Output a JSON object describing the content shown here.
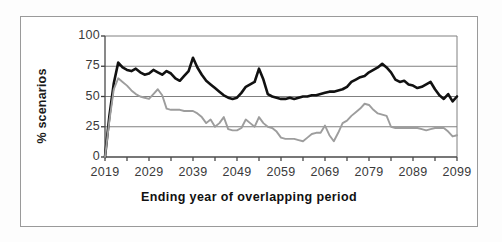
{
  "chart_data": {
    "type": "line",
    "title": "",
    "xlabel": "Ending year of overlapping period",
    "ylabel": "% scenarios",
    "xlim": [
      2019,
      2099
    ],
    "ylim": [
      0,
      100
    ],
    "grid": true,
    "legend": "none",
    "y_ticks": [
      0,
      25,
      50,
      75,
      100
    ],
    "y_tick_labels": [
      "0",
      "25",
      "50",
      "75",
      "100"
    ],
    "x_ticks": [
      2019,
      2029,
      2039,
      2049,
      2059,
      2069,
      2079,
      2089,
      2099
    ],
    "x_tick_labels": [
      "2019",
      "2029",
      "2039",
      "2049",
      "2059",
      "2069",
      "2079",
      "2089",
      "2099"
    ],
    "x_minor_tick_interval": 5,
    "x": [
      2019,
      2020,
      2021,
      2022,
      2023,
      2024,
      2025,
      2026,
      2027,
      2028,
      2029,
      2030,
      2031,
      2032,
      2033,
      2034,
      2035,
      2036,
      2037,
      2038,
      2039,
      2040,
      2041,
      2042,
      2043,
      2044,
      2045,
      2046,
      2047,
      2048,
      2049,
      2050,
      2051,
      2052,
      2053,
      2054,
      2055,
      2056,
      2057,
      2058,
      2059,
      2060,
      2061,
      2062,
      2063,
      2064,
      2065,
      2066,
      2067,
      2068,
      2069,
      2070,
      2071,
      2072,
      2073,
      2074,
      2075,
      2076,
      2077,
      2078,
      2079,
      2080,
      2081,
      2082,
      2083,
      2084,
      2085,
      2086,
      2087,
      2088,
      2089,
      2090,
      2091,
      2092,
      2093,
      2094,
      2095,
      2096,
      2097,
      2098,
      2099
    ],
    "series": [
      {
        "name": "upper-series-black",
        "color": "#111111",
        "line_width": 2.6,
        "values": [
          0,
          34,
          61,
          78,
          74,
          72,
          71,
          73,
          70,
          68,
          69,
          72,
          70,
          68,
          71,
          69,
          65,
          63,
          67,
          71,
          82,
          74,
          68,
          63,
          60,
          57,
          54,
          51,
          49,
          48,
          49,
          53,
          58,
          60,
          62,
          73,
          64,
          52,
          50,
          49,
          48,
          48,
          49,
          48,
          49,
          50,
          50,
          51,
          51,
          52,
          53,
          54,
          54,
          55,
          56,
          58,
          62,
          64,
          66,
          67,
          70,
          72,
          74,
          77,
          74,
          70,
          64,
          62,
          63,
          60,
          59,
          57,
          58,
          60,
          62,
          56,
          51,
          48,
          52,
          46,
          50
        ]
      },
      {
        "name": "lower-series-gray",
        "color": "#9d9d9d",
        "line_width": 1.9,
        "values": [
          0,
          30,
          56,
          65,
          62,
          59,
          55,
          52,
          50,
          49,
          48,
          52,
          56,
          51,
          40,
          39,
          39,
          39,
          38,
          38,
          38,
          36,
          33,
          28,
          31,
          25,
          28,
          33,
          23,
          22,
          22,
          24,
          31,
          28,
          25,
          33,
          28,
          25,
          24,
          21,
          16,
          15,
          15,
          15,
          14,
          13,
          16,
          19,
          20,
          20,
          26,
          18,
          13,
          20,
          28,
          30,
          34,
          37,
          40,
          44,
          43,
          39,
          36,
          35,
          34,
          25,
          24,
          24,
          24,
          24,
          24,
          24,
          23,
          22,
          23,
          24,
          24,
          24,
          21,
          17,
          18
        ]
      }
    ]
  }
}
